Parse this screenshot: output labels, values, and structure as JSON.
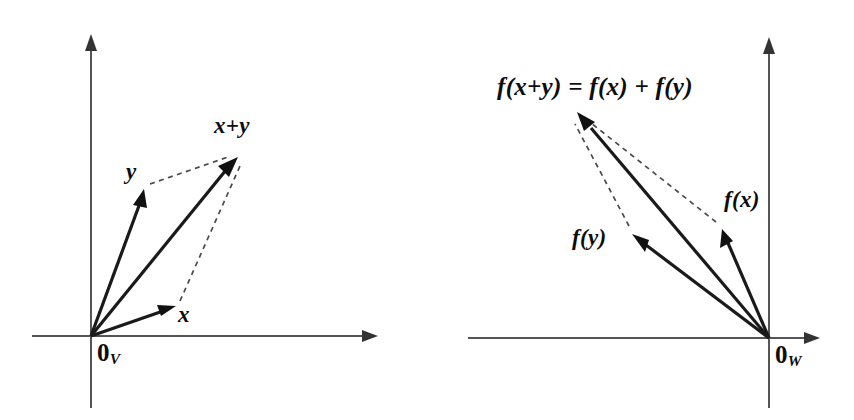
{
  "figure": {
    "background_color": "#ffffff",
    "vector_color": "#111111",
    "axis_color": "#555555",
    "dashed_color": "#4a4a4a"
  },
  "panels": [
    {
      "id": "domain-panel",
      "name": "vector-space-V",
      "origin_label": "0",
      "origin_subscript": "V",
      "axes": {
        "origin": [
          91,
          336
        ],
        "x_axis": {
          "from": [
            32,
            336
          ],
          "to": [
            378,
            336
          ],
          "arrow": "right"
        },
        "y_axis": {
          "from": [
            91,
            408
          ],
          "to": [
            91,
            35
          ],
          "arrow": "up"
        }
      },
      "vectors": [
        {
          "name": "x",
          "label": "x",
          "from": [
            91,
            336
          ],
          "to": [
            175,
            307
          ],
          "label_pos": [
            178,
            303
          ],
          "style": "solid"
        },
        {
          "name": "y",
          "label": "y",
          "from": [
            91,
            336
          ],
          "to": [
            144,
            190
          ],
          "label_pos": [
            126,
            160
          ],
          "style": "solid"
        },
        {
          "name": "x+y",
          "label": "x+y",
          "from": [
            91,
            336
          ],
          "to": [
            237,
            158
          ],
          "label_pos": [
            214,
            118
          ],
          "style": "solid"
        }
      ],
      "dashed_edges": [
        {
          "name": "y-to-sum",
          "from": [
            148,
            184
          ],
          "to": [
            233,
            155
          ]
        },
        {
          "name": "x-to-sum",
          "from": [
            179,
            303
          ],
          "to": [
            240,
            163
          ]
        }
      ]
    },
    {
      "id": "codomain-panel",
      "name": "vector-space-W",
      "origin_label": "0",
      "origin_subscript": "W",
      "axes": {
        "origin": [
          769,
          338
        ],
        "x_axis": {
          "from": [
            468,
            338
          ],
          "to": [
            820,
            338
          ],
          "arrow": "right"
        },
        "y_axis": {
          "from": [
            769,
            408
          ],
          "to": [
            769,
            38
          ],
          "arrow": "up"
        }
      },
      "vectors": [
        {
          "name": "f(x)",
          "label": "f(x)",
          "from": [
            769,
            338
          ],
          "to": [
            723,
            230
          ],
          "label_pos": [
            725,
            190
          ],
          "style": "solid"
        },
        {
          "name": "f(y)",
          "label": "f(y)",
          "from": [
            769,
            338
          ],
          "to": [
            633,
            235
          ],
          "label_pos": [
            571,
            228
          ],
          "style": "solid"
        },
        {
          "name": "f(x+y)",
          "label": "f(x+y) = f(x) + f(y)",
          "from": [
            769,
            338
          ],
          "to": [
            578,
            113
          ],
          "label_pos": [
            498,
            76
          ],
          "style": "solid"
        }
      ],
      "dashed_edges": [
        {
          "name": "fx-to-sum",
          "from": [
            719,
            224
          ],
          "to": [
            584,
            116
          ]
        },
        {
          "name": "fy-to-sum",
          "from": [
            630,
            228
          ],
          "to": [
            576,
            122
          ]
        }
      ]
    }
  ],
  "labels": {
    "left": {
      "x": "x",
      "y": "y",
      "sum": "x+y",
      "origin": "0",
      "origin_sub": "V"
    },
    "right": {
      "fx": "f(x)",
      "fy": "f(y)",
      "equation": "f(x+y) = f(x) + f(y)",
      "origin": "0",
      "origin_sub": "W"
    }
  }
}
